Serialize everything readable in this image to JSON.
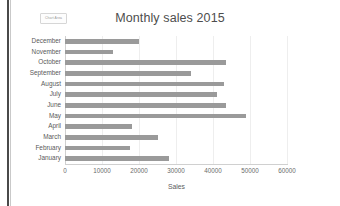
{
  "window": {
    "edge_color": "#4a4a4a",
    "background": "#ffffff"
  },
  "toolbar": {
    "chart_elements_button_label": "Chart Area"
  },
  "chart_data": {
    "type": "bar",
    "orientation": "horizontal",
    "title": "Monthly sales 2015",
    "xlabel": "Sales",
    "ylabel": "",
    "categories": [
      "December",
      "November",
      "October",
      "September",
      "August",
      "July",
      "June",
      "May",
      "April",
      "March",
      "February",
      "January"
    ],
    "values": [
      20000,
      13000,
      43500,
      34000,
      43000,
      41000,
      43500,
      49000,
      18000,
      25000,
      17500,
      28000
    ],
    "series": [
      {
        "name": "Sales",
        "values": [
          20000,
          13000,
          43500,
          34000,
          43000,
          41000,
          43500,
          49000,
          18000,
          25000,
          17500,
          28000
        ]
      }
    ],
    "xlim": [
      0,
      60000
    ],
    "xticks": [
      0,
      10000,
      20000,
      30000,
      40000,
      50000,
      60000
    ],
    "xtick_labels": [
      "0",
      "10000",
      "20000",
      "30000",
      "40000",
      "50000",
      "60000"
    ],
    "grid": true,
    "legend": false,
    "bar_color": "#9a9a9a",
    "grid_color": "#eeeeee",
    "axis_color": "#d0d0d0",
    "title_color": "#4d4d4d"
  }
}
